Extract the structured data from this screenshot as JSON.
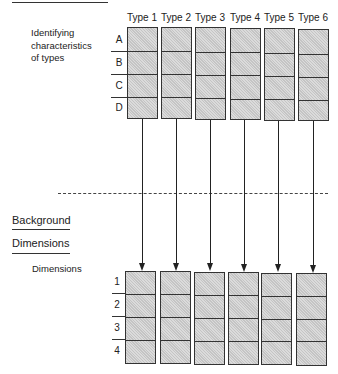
{
  "top_section": {
    "caption_lines": [
      "Identifying",
      "characteristics",
      "of types"
    ],
    "types": [
      "Type 1",
      "Type 2",
      "Type 3",
      "Type 4",
      "Type 5",
      "Type 6"
    ],
    "rows": [
      "A",
      "B",
      "C",
      "D"
    ]
  },
  "bottom_section": {
    "heading_lines": [
      "Background",
      "Dimensions"
    ],
    "caption": "Dimensions",
    "rows": [
      "1",
      "2",
      "3",
      "4"
    ]
  },
  "colors": {
    "box_fill": "#cfcfcf",
    "stroke": "#333333"
  }
}
